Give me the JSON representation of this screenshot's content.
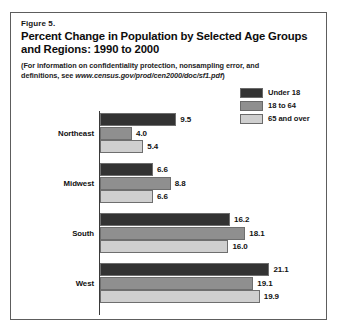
{
  "figure": {
    "number": "Figure 5.",
    "title": "Percent Change in Population by Selected Age Groups and Regions:  1990 to 2000",
    "note_prefix": "(For information on confidentiality protection, nonsampling error, and definitions, see ",
    "note_url": "www.census.gov/prod/cen2000/doc/sf1.pdf",
    "note_suffix": ")"
  },
  "colors": {
    "under18": "#333333",
    "age18to64": "#8f8f8f",
    "age65over": "#cfcfcf",
    "axis": "#3a3a3a",
    "frame": "#5d5d5d",
    "text": "#111111",
    "background": "#ffffff"
  },
  "legend": {
    "position": "top-right",
    "items": [
      {
        "label": "Under 18",
        "color": "#333333"
      },
      {
        "label": "18 to 64",
        "color": "#8f8f8f"
      },
      {
        "label": "65 and over",
        "color": "#cfcfcf"
      }
    ]
  },
  "chart_data": {
    "type": "bar",
    "orientation": "horizontal",
    "title": "Percent Change in Population by Selected Age Groups and Regions:  1990 to 2000",
    "xlabel": "",
    "ylabel": "",
    "xlim": [
      0,
      21.1
    ],
    "grid": false,
    "legend_position": "top-right",
    "categories": [
      "Northeast",
      "Midwest",
      "South",
      "West"
    ],
    "series": [
      {
        "name": "Under 18",
        "color": "#333333",
        "values": [
          9.5,
          6.6,
          16.2,
          21.1
        ]
      },
      {
        "name": "18 to 64",
        "color": "#8f8f8f",
        "values": [
          4.0,
          8.8,
          18.1,
          19.1
        ]
      },
      {
        "name": "65 and over",
        "color": "#cfcfcf",
        "values": [
          5.4,
          6.6,
          16.0,
          19.9
        ]
      }
    ],
    "value_labels": [
      [
        "9.5",
        "4.0",
        "5.4"
      ],
      [
        "6.6",
        "8.8",
        "6.6"
      ],
      [
        "16.2",
        "18.1",
        "16.0"
      ],
      [
        "21.1",
        "19.1",
        "19.9"
      ]
    ]
  }
}
